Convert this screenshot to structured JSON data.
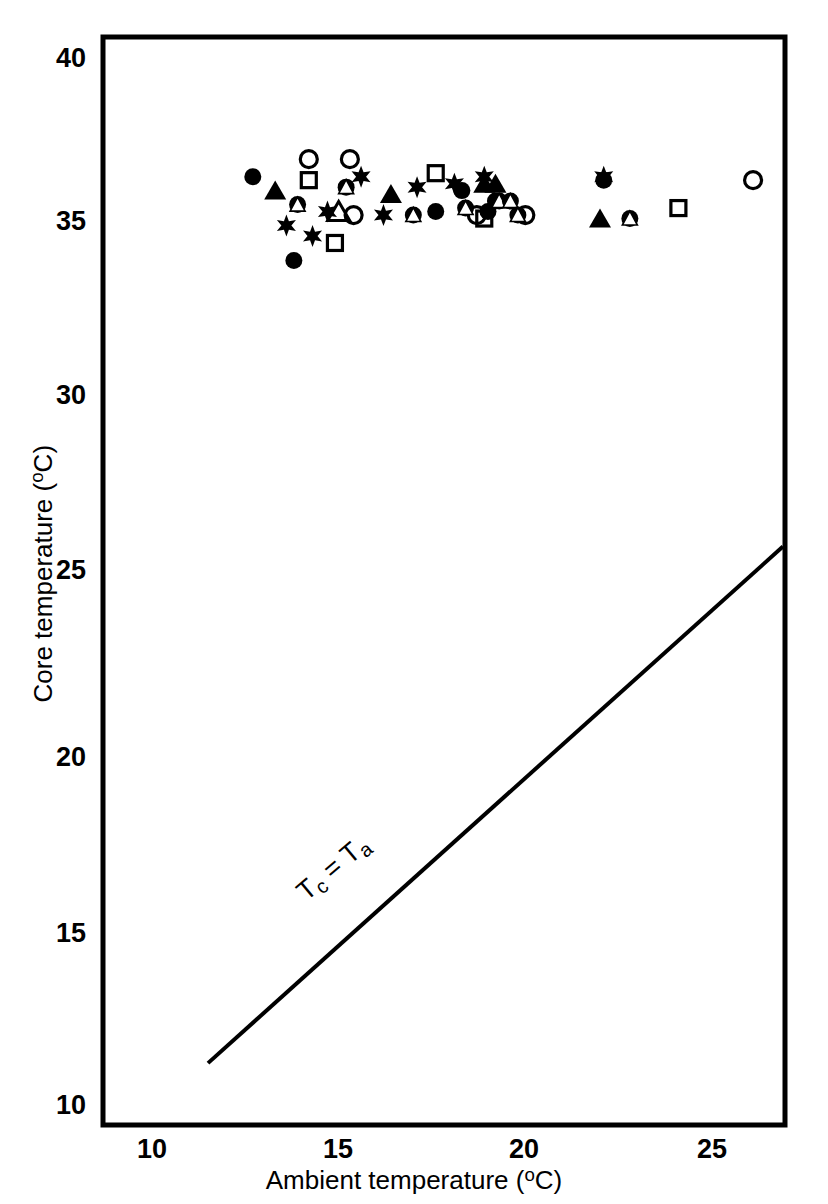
{
  "chart_data": {
    "type": "scatter",
    "title": "",
    "xlabel": "Ambient temperature (°C)",
    "ylabel": "Core temperature (°C)",
    "xlim": [
      8.5,
      26.9
    ],
    "ylim": [
      10,
      40.4
    ],
    "xticks": [
      10,
      15,
      20,
      25
    ],
    "yticks": [
      10,
      15,
      20,
      25,
      30,
      35,
      40
    ],
    "grid": false,
    "legend": "none",
    "annotations": [
      {
        "text": "Tc = Ta",
        "x": 15.0,
        "y": 16.6,
        "rotation": -40,
        "description": "label along the line of equality"
      }
    ],
    "reference_line": {
      "name": "Tc = Ta",
      "type": "line",
      "x": [
        11.5,
        26.9
      ],
      "y": [
        11.2,
        26.0
      ],
      "width": 4
    },
    "marker_kinds": [
      "filled-circle",
      "open-circle",
      "filled-triangle",
      "open-triangle",
      "open-square",
      "filled-star",
      "overlapped-circle-triangle"
    ],
    "series": [
      {
        "name": "filled-circle",
        "marker": "filled-circle",
        "points": [
          [
            12.7,
            36.6
          ],
          [
            13.8,
            34.2
          ],
          [
            17.6,
            35.6
          ],
          [
            18.3,
            36.2
          ],
          [
            19.0,
            35.6
          ],
          [
            19.2,
            35.9
          ],
          [
            22.1,
            36.5
          ]
        ]
      },
      {
        "name": "open-circle",
        "marker": "open-circle",
        "points": [
          [
            14.2,
            37.1
          ],
          [
            15.3,
            37.1
          ],
          [
            15.4,
            35.5
          ],
          [
            18.7,
            35.5
          ],
          [
            20.0,
            35.5
          ],
          [
            26.1,
            36.5
          ]
        ]
      },
      {
        "name": "filled-triangle",
        "marker": "filled-triangle",
        "points": [
          [
            13.3,
            36.2
          ],
          [
            16.4,
            36.1
          ],
          [
            18.9,
            36.4
          ],
          [
            19.2,
            36.4
          ],
          [
            22.0,
            35.4
          ]
        ]
      },
      {
        "name": "open-triangle",
        "marker": "open-triangle",
        "points": [
          [
            15.0,
            35.6
          ]
        ]
      },
      {
        "name": "open-square",
        "marker": "open-square",
        "points": [
          [
            14.2,
            36.5
          ],
          [
            14.9,
            34.7
          ],
          [
            17.6,
            36.7
          ],
          [
            18.9,
            35.4
          ],
          [
            24.1,
            35.7
          ]
        ]
      },
      {
        "name": "filled-star",
        "marker": "filled-star",
        "points": [
          [
            13.6,
            35.2
          ],
          [
            14.3,
            34.9
          ],
          [
            14.7,
            35.6
          ],
          [
            15.6,
            36.6
          ],
          [
            16.2,
            35.5
          ],
          [
            17.1,
            36.3
          ],
          [
            18.1,
            36.4
          ],
          [
            18.9,
            36.6
          ],
          [
            22.1,
            36.6
          ]
        ]
      },
      {
        "name": "overlapped-circle-triangle",
        "marker": "overlapped-circle-triangle",
        "points": [
          [
            13.9,
            35.8
          ],
          [
            15.2,
            36.3
          ],
          [
            17.0,
            35.5
          ],
          [
            18.4,
            35.7
          ],
          [
            19.3,
            35.9
          ],
          [
            19.6,
            35.9
          ],
          [
            19.8,
            35.5
          ],
          [
            22.8,
            35.4
          ]
        ]
      }
    ]
  },
  "axes": {
    "y_tick_labels": [
      "40",
      "35",
      "30",
      "25",
      "20",
      "15",
      "10"
    ],
    "x_tick_labels": [
      "10",
      "15",
      "20",
      "25"
    ],
    "y_title_main": "Core temperature (",
    "y_title_unit": "o",
    "y_title_tail": "C)",
    "x_title_main": "Ambient temperature (",
    "x_title_unit": "o",
    "x_title_tail": "C)"
  },
  "line_label": {
    "tc": "T",
    "tc_sub": "c",
    "eq": " = T",
    "ta_sub": "a",
    "full": "Tc = Ta"
  },
  "style": {
    "frame_color": "#000000",
    "marker_color": "#000000",
    "background": "#ffffff"
  }
}
